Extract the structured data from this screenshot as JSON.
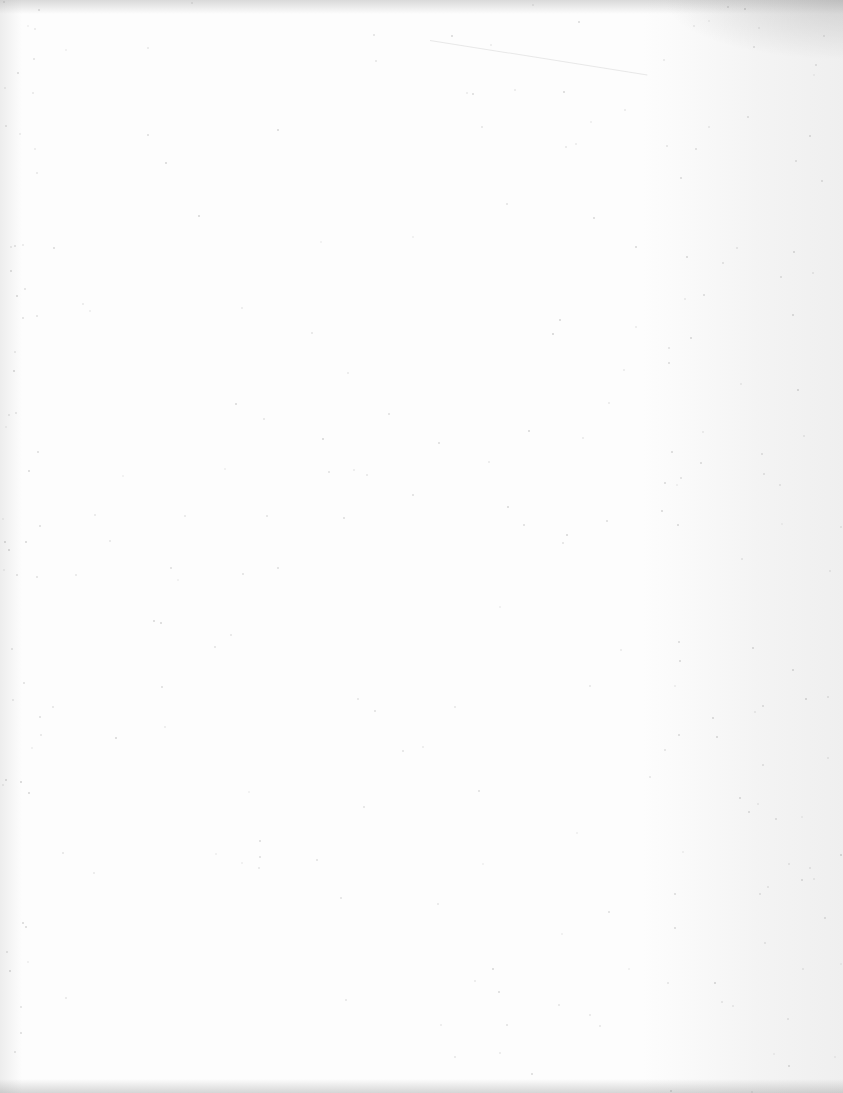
{
  "page": {
    "type": "blank-scanned-page",
    "content": []
  }
}
